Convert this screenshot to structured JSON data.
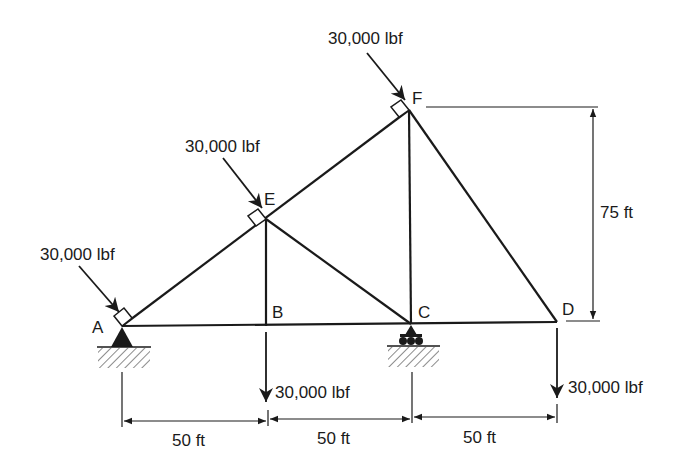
{
  "diagram": {
    "type": "truss",
    "nodes": {
      "A": "A",
      "B": "B",
      "C": "C",
      "D": "D",
      "E": "E",
      "F": "F"
    },
    "loads": {
      "A": "30,000 lbf",
      "E": "30,000 lbf",
      "F": "30,000 lbf",
      "B": "30,000 lbf",
      "D": "30,000 lbf"
    },
    "dimensions": {
      "AB": "50 ft",
      "BC": "50 ft",
      "CD": "50 ft",
      "height": "75 ft"
    },
    "supports": {
      "A": "pin-support",
      "C": "roller-support"
    },
    "colors": {
      "line": "#1a1a1a",
      "background": "#ffffff"
    }
  }
}
